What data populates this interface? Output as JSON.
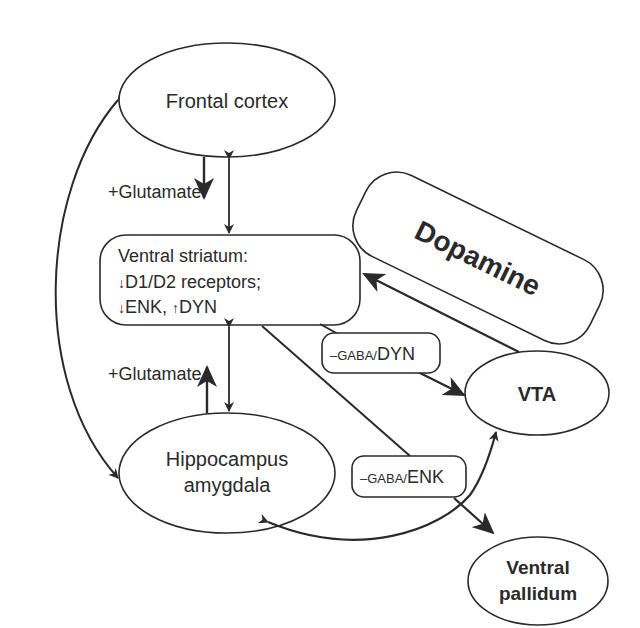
{
  "nodes": {
    "frontal_cortex": {
      "label": "Frontal cortex"
    },
    "ventral_striatum": {
      "line1": "Ventral striatum:",
      "line2_arrow": "↓",
      "line2": "D1/D2 receptors;",
      "line3_arrow1": "↓",
      "line3_a": "ENK, ",
      "line3_arrow2": "↑",
      "line3_b": "DYN"
    },
    "hippocampus_amygdala": {
      "line1": "Hippocampus",
      "line2": "amygdala"
    },
    "dopamine": {
      "label": "Dopamine"
    },
    "vta": {
      "label": "VTA"
    },
    "ventral_pallidum": {
      "line1": "Ventral",
      "line2": "pallidum"
    }
  },
  "edge_labels": {
    "glutamate_top": "+Glutamate",
    "glutamate_bottom": "+Glutamate",
    "gaba_dyn": {
      "prefix": "–GABA/",
      "suffix": "DYN"
    },
    "gaba_enk": {
      "prefix": "–GABA/",
      "suffix": "ENK"
    }
  },
  "colors": {
    "line": "#2a2a2a",
    "background": "#ffffff"
  }
}
